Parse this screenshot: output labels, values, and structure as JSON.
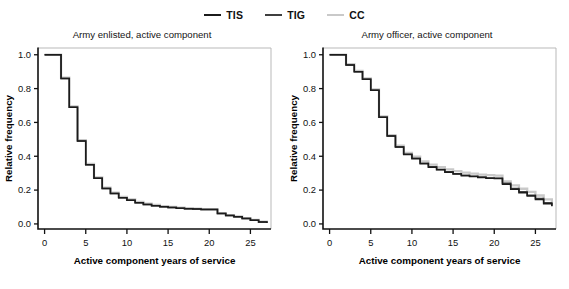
{
  "figure": {
    "width": 569,
    "height": 289,
    "background": "#ffffff"
  },
  "legend": {
    "position": "top-center",
    "entries": [
      {
        "label": "TIS",
        "color": "#1b1b1b",
        "icon": "line-swatch-icon"
      },
      {
        "label": "TIG",
        "color": "#3f3f3f",
        "icon": "line-swatch-icon"
      },
      {
        "label": "CC",
        "color": "#c9c9c9",
        "icon": "line-swatch-icon"
      }
    ]
  },
  "chart_data": [
    {
      "type": "line",
      "panel": "left",
      "title": "Army enlisted, active component",
      "xlabel": "Active component years of service",
      "ylabel": "Relative frequency",
      "xlim": [
        -0.8,
        27.5
      ],
      "ylim": [
        -0.03,
        1.04
      ],
      "xticks": [
        0,
        5,
        10,
        15,
        20,
        25
      ],
      "xticklabels": [
        "0",
        "5",
        "10",
        "15",
        "20",
        "25"
      ],
      "yticks": [
        0.0,
        0.2,
        0.4,
        0.6,
        0.8,
        1.0
      ],
      "yticklabels": [
        "0.0",
        "0.2",
        "0.4",
        "0.6",
        "0.8",
        "1.0"
      ],
      "grid": false,
      "drawstyle": "steps-post",
      "series": [
        {
          "name": "TIS",
          "color": "#1b1b1b",
          "x": [
            0,
            1,
            2,
            3,
            4,
            5,
            6,
            7,
            8,
            9,
            10,
            11,
            12,
            13,
            14,
            15,
            16,
            17,
            18,
            19,
            20,
            21,
            22,
            23,
            24,
            25,
            26,
            27
          ],
          "values": [
            1.0,
            1.0,
            0.86,
            0.69,
            0.49,
            0.35,
            0.27,
            0.21,
            0.18,
            0.155,
            0.14,
            0.125,
            0.115,
            0.108,
            0.102,
            0.097,
            0.093,
            0.09,
            0.088,
            0.086,
            0.085,
            0.062,
            0.05,
            0.042,
            0.032,
            0.022,
            0.012,
            0.006
          ]
        },
        {
          "name": "TIG",
          "color": "#3f3f3f",
          "x": [
            0,
            1,
            2,
            3,
            4,
            5,
            6,
            7,
            8,
            9,
            10,
            11,
            12,
            13,
            14,
            15,
            16,
            17,
            18,
            19,
            20,
            21,
            22,
            23,
            24,
            25,
            26,
            27
          ],
          "values": [
            1.0,
            1.0,
            0.86,
            0.69,
            0.49,
            0.35,
            0.27,
            0.21,
            0.18,
            0.155,
            0.14,
            0.125,
            0.115,
            0.108,
            0.102,
            0.097,
            0.093,
            0.09,
            0.088,
            0.086,
            0.085,
            0.062,
            0.05,
            0.042,
            0.032,
            0.022,
            0.012,
            0.006
          ]
        },
        {
          "name": "CC",
          "color": "#c9c9c9",
          "x": [
            0,
            1,
            2,
            3,
            4,
            5,
            6,
            7,
            8,
            9,
            10,
            11,
            12,
            13,
            14,
            15,
            16,
            17,
            18,
            19,
            20,
            21,
            22,
            23,
            24,
            25,
            26,
            27
          ],
          "values": [
            1.0,
            1.0,
            0.865,
            0.695,
            0.495,
            0.355,
            0.275,
            0.215,
            0.185,
            0.16,
            0.145,
            0.13,
            0.12,
            0.112,
            0.105,
            0.1,
            0.096,
            0.093,
            0.09,
            0.088,
            0.087,
            0.064,
            0.052,
            0.044,
            0.034,
            0.024,
            0.013,
            0.007
          ]
        }
      ]
    },
    {
      "type": "line",
      "panel": "right",
      "title": "Army officer, active component",
      "xlabel": "Active component years of service",
      "ylabel": "Relative frequency",
      "xlim": [
        -0.8,
        27.5
      ],
      "ylim": [
        -0.03,
        1.04
      ],
      "xticks": [
        0,
        5,
        10,
        15,
        20,
        25
      ],
      "xticklabels": [
        "0",
        "5",
        "10",
        "15",
        "20",
        "25"
      ],
      "yticks": [
        0.0,
        0.2,
        0.4,
        0.6,
        0.8,
        1.0
      ],
      "yticklabels": [
        "0.0",
        "0.2",
        "0.4",
        "0.6",
        "0.8",
        "1.0"
      ],
      "grid": false,
      "drawstyle": "steps-post",
      "series": [
        {
          "name": "TIS",
          "color": "#1b1b1b",
          "x": [
            0,
            1,
            2,
            3,
            4,
            5,
            6,
            7,
            8,
            9,
            10,
            11,
            12,
            13,
            14,
            15,
            16,
            17,
            18,
            19,
            20,
            21,
            22,
            23,
            24,
            25,
            26,
            27
          ],
          "values": [
            1.0,
            1.0,
            0.94,
            0.9,
            0.855,
            0.79,
            0.63,
            0.52,
            0.455,
            0.41,
            0.385,
            0.355,
            0.335,
            0.32,
            0.305,
            0.295,
            0.285,
            0.28,
            0.275,
            0.27,
            0.268,
            0.235,
            0.205,
            0.185,
            0.165,
            0.145,
            0.12,
            0.105
          ]
        },
        {
          "name": "TIG",
          "color": "#3f3f3f",
          "x": [
            0,
            1,
            2,
            3,
            4,
            5,
            6,
            7,
            8,
            9,
            10,
            11,
            12,
            13,
            14,
            15,
            16,
            17,
            18,
            19,
            20,
            21,
            22,
            23,
            24,
            25,
            26,
            27
          ],
          "values": [
            1.0,
            1.0,
            0.94,
            0.9,
            0.855,
            0.79,
            0.63,
            0.52,
            0.455,
            0.412,
            0.388,
            0.358,
            0.338,
            0.322,
            0.308,
            0.297,
            0.288,
            0.282,
            0.277,
            0.272,
            0.27,
            0.24,
            0.21,
            0.19,
            0.17,
            0.15,
            0.125,
            0.108
          ]
        },
        {
          "name": "CC",
          "color": "#c9c9c9",
          "x": [
            0,
            1,
            2,
            3,
            4,
            5,
            6,
            7,
            8,
            9,
            10,
            11,
            12,
            13,
            14,
            15,
            16,
            17,
            18,
            19,
            20,
            21,
            22,
            23,
            24,
            25,
            26,
            27
          ],
          "values": [
            1.0,
            1.0,
            0.945,
            0.905,
            0.86,
            0.795,
            0.635,
            0.525,
            0.462,
            0.42,
            0.398,
            0.37,
            0.35,
            0.335,
            0.322,
            0.312,
            0.303,
            0.297,
            0.292,
            0.288,
            0.285,
            0.252,
            0.228,
            0.208,
            0.19,
            0.168,
            0.145,
            0.128
          ]
        }
      ]
    }
  ]
}
